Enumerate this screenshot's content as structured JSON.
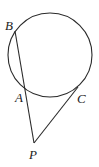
{
  "diagram": {
    "type": "geometry",
    "colors": {
      "stroke": "#2a2a2a",
      "label": "#222222",
      "background": "#ffffff"
    },
    "circle": {
      "cx": 50,
      "cy": 55,
      "r": 42
    },
    "points": {
      "B": {
        "label": "B",
        "x": 15,
        "y": 31,
        "label_x": 5,
        "label_y": 30
      },
      "A": {
        "label": "A",
        "x": 25,
        "y": 89,
        "label_x": 15,
        "label_y": 102
      },
      "C": {
        "label": "C",
        "x": 78,
        "y": 87,
        "label_x": 77,
        "label_y": 103
      },
      "P": {
        "label": "P",
        "x": 34,
        "y": 143,
        "label_x": 29,
        "label_y": 159
      }
    },
    "segments": [
      {
        "from": "B",
        "to": "P"
      },
      {
        "from": "C",
        "to": "P"
      }
    ]
  }
}
